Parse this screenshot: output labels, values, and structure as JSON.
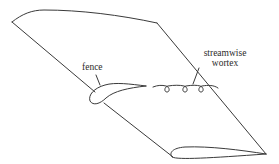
{
  "diagram": {
    "type": "swept wing with wing fence and streamwise vortex",
    "colors": {
      "line": "#3a3a3a",
      "text": "#2a2a2a",
      "background": "#ffffff"
    },
    "labels": {
      "fence": "fence",
      "vortex_line1": "streamwise",
      "vortex_line2": "wortex"
    }
  }
}
